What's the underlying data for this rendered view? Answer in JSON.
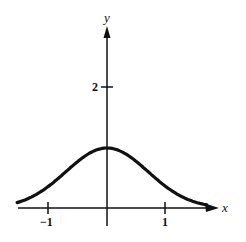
{
  "chart_data": {
    "type": "line",
    "title": "",
    "xlabel": "x",
    "ylabel": "y",
    "function": "y = e^(-x^2)",
    "x_ticks": [
      -1,
      1
    ],
    "x_tick_labels": [
      "−1",
      "1"
    ],
    "y_ticks": [
      2
    ],
    "y_tick_labels": [
      "2"
    ],
    "xlim": [
      -1.55,
      1.9
    ],
    "ylim": [
      0,
      3.0
    ],
    "grid": false,
    "legend": null,
    "series": [
      {
        "name": "curve",
        "x": [
          -1.55,
          -1.25,
          -1.0,
          -0.75,
          -0.5,
          -0.25,
          0,
          0.25,
          0.5,
          0.75,
          1.0,
          1.25,
          1.5,
          1.75,
          1.85
        ],
        "y": [
          0.09,
          0.21,
          0.37,
          0.57,
          0.78,
          0.94,
          1.0,
          0.94,
          0.78,
          0.57,
          0.37,
          0.21,
          0.11,
          0.05,
          0.03
        ]
      }
    ],
    "color": "#111111"
  },
  "labels": {
    "x_axis": "x",
    "y_axis": "y",
    "tick_neg1": "−1",
    "tick_1": "1",
    "tick_2": "2"
  }
}
